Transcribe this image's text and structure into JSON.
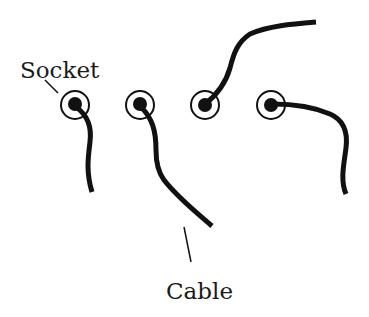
{
  "diagram": {
    "labels": {
      "socket": "Socket",
      "cable": "Cable"
    },
    "colors": {
      "ink": "#111111",
      "background": "#ffffff"
    },
    "sockets": [
      {
        "id": 1,
        "cx": 75,
        "cy": 105,
        "cable": "short, curving downward"
      },
      {
        "id": 2,
        "cx": 140,
        "cy": 105,
        "cable": "long, angled down-right"
      },
      {
        "id": 3,
        "cx": 205,
        "cy": 105,
        "cable": "rising up-right"
      },
      {
        "id": 4,
        "cx": 271,
        "cy": 105,
        "cable": "right then bending down"
      }
    ]
  }
}
